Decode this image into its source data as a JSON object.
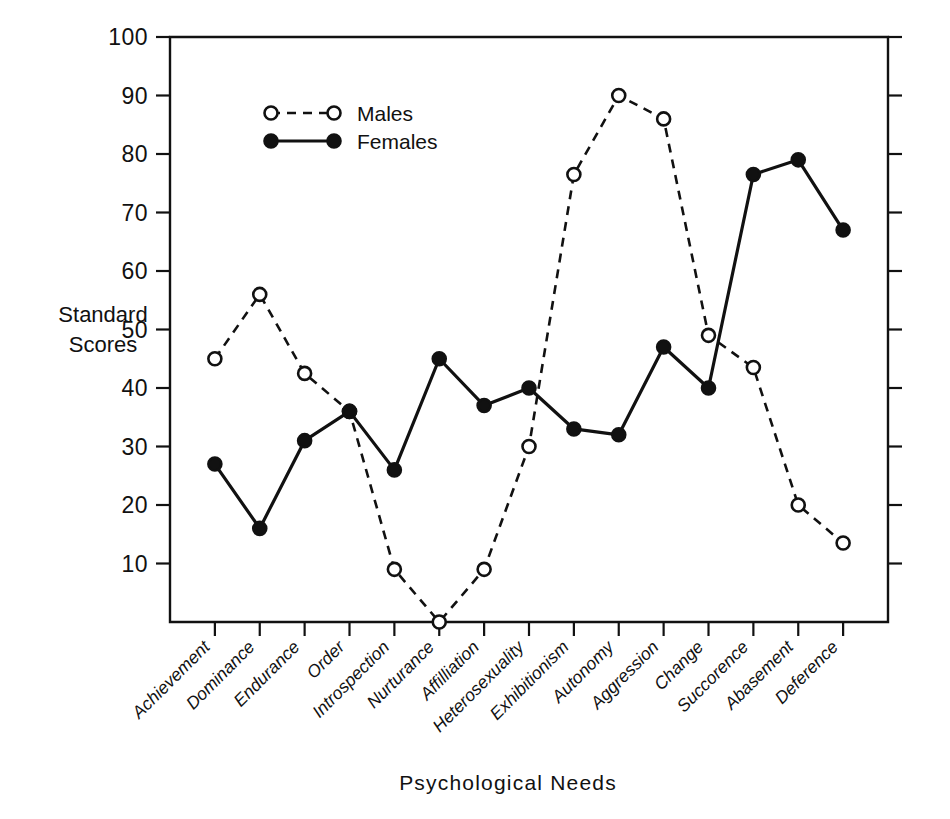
{
  "chart_data": {
    "type": "line",
    "title": "",
    "xlabel": "Psychological  Needs",
    "ylabel_line1": "Standard",
    "ylabel_line2": "Scores",
    "ylim": [
      0,
      100
    ],
    "ytick_values": [
      10,
      20,
      30,
      40,
      50,
      60,
      70,
      80,
      90,
      100
    ],
    "ytick_labels": [
      "10",
      "20",
      "30",
      "40",
      "50",
      "60",
      "70",
      "80",
      "90",
      "100"
    ],
    "grid": false,
    "legend_position": "upper-left-inside",
    "categories": [
      "Achievement",
      "Dominance",
      "Endurance",
      "Order",
      "Introspection",
      "Nurturance",
      "Affilliation",
      "Heterosexuality",
      "Exhibitionism",
      "Autonomy",
      "Aggression",
      "Change",
      "Succorence",
      "Abasement",
      "Deference"
    ],
    "series": [
      {
        "name": "Males",
        "marker": "open-circle",
        "linestyle": "dashed",
        "color": "#111111",
        "values": [
          45,
          56,
          42.5,
          36,
          9,
          0,
          9,
          30,
          76.5,
          90,
          86,
          49,
          43.5,
          20,
          13.5
        ]
      },
      {
        "name": "Females",
        "marker": "filled-circle",
        "linestyle": "solid",
        "color": "#111111",
        "values": [
          27,
          16,
          31,
          36,
          26,
          45,
          37,
          40,
          33,
          32,
          47,
          40,
          76.5,
          79,
          67
        ]
      }
    ]
  },
  "legend": {
    "entries": [
      {
        "label": "Males"
      },
      {
        "label": "Females"
      }
    ]
  },
  "axes": {
    "y_title_line1": "Standard",
    "y_title_line2": "Scores",
    "x_title": "Psychological  Needs"
  }
}
